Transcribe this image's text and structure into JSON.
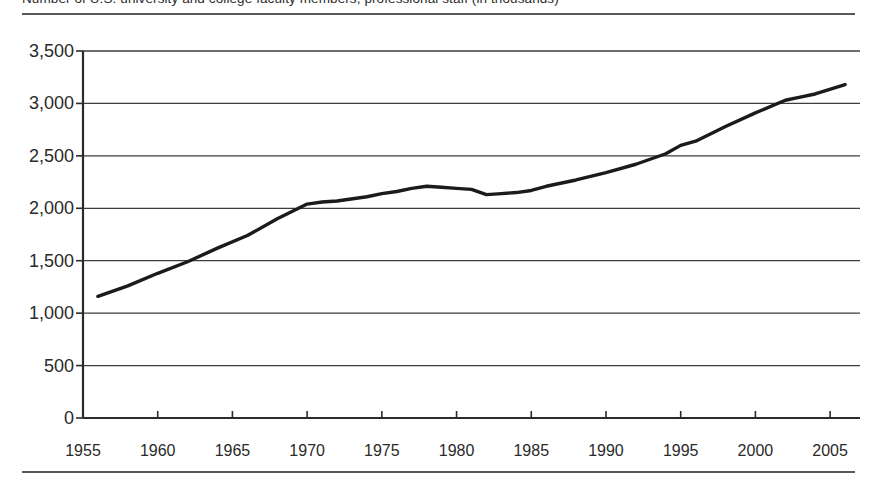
{
  "figure": {
    "caption_clipped": "Number of U.S. university and college faculty members, professional staff (in thousands)",
    "top_rule": "rule",
    "bottom_rule": "rule"
  },
  "chart_data": {
    "type": "line",
    "title": "",
    "xlabel": "",
    "ylabel": "",
    "xlim": [
      1955,
      2007
    ],
    "ylim": [
      0,
      3500
    ],
    "grid": true,
    "legend": "none",
    "y_ticks": [
      0,
      500,
      1000,
      1500,
      2000,
      2500,
      3000,
      3500
    ],
    "y_tick_labels": [
      "0",
      "500",
      "1,000",
      "1,500",
      "2,000",
      "2,500",
      "3,000",
      "3,500"
    ],
    "x_ticks": [
      1955,
      1960,
      1965,
      1970,
      1975,
      1980,
      1985,
      1990,
      1995,
      2000,
      2005
    ],
    "x_tick_labels": [
      "1955",
      "1960",
      "1965",
      "1970",
      "1975",
      "1980",
      "1985",
      "1990",
      "1995",
      "2000",
      "2005"
    ],
    "x": [
      1956,
      1958,
      1960,
      1962,
      1964,
      1966,
      1968,
      1970,
      1971,
      1972,
      1974,
      1975,
      1976,
      1977,
      1978,
      1979,
      1980,
      1981,
      1982,
      1983,
      1984,
      1985,
      1986,
      1988,
      1990,
      1992,
      1994,
      1995,
      1996,
      1998,
      2000,
      2002,
      2003,
      2004,
      2006
    ],
    "values": [
      1160,
      1260,
      1380,
      1490,
      1620,
      1740,
      1900,
      2040,
      2060,
      2070,
      2110,
      2140,
      2160,
      2190,
      2210,
      2200,
      2190,
      2180,
      2130,
      2140,
      2150,
      2170,
      2210,
      2270,
      2340,
      2420,
      2520,
      2600,
      2640,
      2780,
      2910,
      3030,
      3060,
      3090,
      3180
    ],
    "series": [
      {
        "name": "value",
        "color": "#1b1b1b",
        "values": [
          1160,
          1260,
          1380,
          1490,
          1620,
          1740,
          1900,
          2040,
          2060,
          2070,
          2110,
          2140,
          2160,
          2190,
          2210,
          2200,
          2190,
          2180,
          2130,
          2140,
          2150,
          2170,
          2210,
          2270,
          2340,
          2420,
          2520,
          2600,
          2640,
          2780,
          2910,
          3030,
          3060,
          3090,
          3180
        ]
      }
    ]
  }
}
